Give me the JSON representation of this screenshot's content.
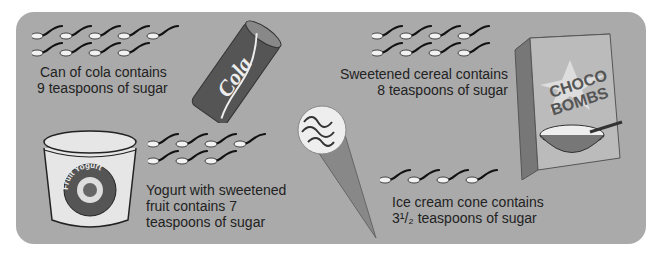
{
  "items": [
    {
      "name": "cola",
      "caption_lines": [
        "Can of cola contains",
        "9 teaspoons of sugar"
      ],
      "teaspoons": 9,
      "label": "Cola"
    },
    {
      "name": "cereal",
      "caption_lines": [
        "Sweetened cereal contains",
        "8 teaspoons of sugar"
      ],
      "teaspoons": 8,
      "label_lines": [
        "CHOCO",
        "BOMBS"
      ]
    },
    {
      "name": "yogurt",
      "caption_lines": [
        "Yogurt with sweetened",
        "fruit contains 7",
        "teaspoons of sugar"
      ],
      "teaspoons": 7,
      "label": "Fruit Yogurt"
    },
    {
      "name": "ice-cream",
      "caption_lines": [
        "Ice cream cone contains",
        "3¹/₂ teaspoons of sugar"
      ],
      "teaspoons": 3.5
    }
  ],
  "colors": {
    "panel": "#aaaaaa",
    "can": "#555555",
    "spoon_bowl": "#f2f2f2",
    "text": "#222222"
  }
}
